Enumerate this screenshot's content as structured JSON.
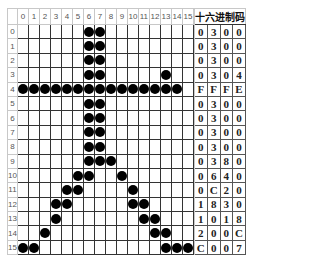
{
  "header": {
    "hex_title": "十六进制码"
  },
  "columns": [
    "0",
    "1",
    "2",
    "3",
    "4",
    "5",
    "6",
    "7",
    "8",
    "9",
    "10",
    "11",
    "12",
    "13",
    "14",
    "15"
  ],
  "rows": [
    {
      "label": "0",
      "bits": [
        0,
        0,
        0,
        0,
        0,
        0,
        1,
        1,
        0,
        0,
        0,
        0,
        0,
        0,
        0,
        0
      ],
      "hex": [
        "0",
        "3",
        "0",
        "0"
      ]
    },
    {
      "label": "1",
      "bits": [
        0,
        0,
        0,
        0,
        0,
        0,
        1,
        1,
        0,
        0,
        0,
        0,
        0,
        0,
        0,
        0
      ],
      "hex": [
        "0",
        "3",
        "0",
        "0"
      ]
    },
    {
      "label": "2",
      "bits": [
        0,
        0,
        0,
        0,
        0,
        0,
        1,
        1,
        0,
        0,
        0,
        0,
        0,
        0,
        0,
        0
      ],
      "hex": [
        "0",
        "3",
        "0",
        "0"
      ]
    },
    {
      "label": "3",
      "bits": [
        0,
        0,
        0,
        0,
        0,
        0,
        1,
        1,
        0,
        0,
        0,
        0,
        0,
        1,
        0,
        0
      ],
      "hex": [
        "0",
        "3",
        "0",
        "4"
      ]
    },
    {
      "label": "4",
      "bits": [
        1,
        1,
        1,
        1,
        1,
        1,
        1,
        1,
        1,
        1,
        1,
        1,
        1,
        1,
        1,
        0
      ],
      "hex": [
        "F",
        "F",
        "F",
        "E"
      ]
    },
    {
      "label": "5",
      "bits": [
        0,
        0,
        0,
        0,
        0,
        0,
        1,
        1,
        0,
        0,
        0,
        0,
        0,
        0,
        0,
        0
      ],
      "hex": [
        "0",
        "3",
        "0",
        "0"
      ]
    },
    {
      "label": "6",
      "bits": [
        0,
        0,
        0,
        0,
        0,
        0,
        1,
        1,
        0,
        0,
        0,
        0,
        0,
        0,
        0,
        0
      ],
      "hex": [
        "0",
        "3",
        "0",
        "0"
      ]
    },
    {
      "label": "7",
      "bits": [
        0,
        0,
        0,
        0,
        0,
        0,
        1,
        1,
        0,
        0,
        0,
        0,
        0,
        0,
        0,
        0
      ],
      "hex": [
        "0",
        "3",
        "0",
        "0"
      ]
    },
    {
      "label": "8",
      "bits": [
        0,
        0,
        0,
        0,
        0,
        0,
        1,
        1,
        0,
        0,
        0,
        0,
        0,
        0,
        0,
        0
      ],
      "hex": [
        "0",
        "3",
        "0",
        "0"
      ]
    },
    {
      "label": "9",
      "bits": [
        0,
        0,
        0,
        0,
        0,
        0,
        1,
        1,
        1,
        0,
        0,
        0,
        0,
        0,
        0,
        0
      ],
      "hex": [
        "0",
        "3",
        "8",
        "0"
      ]
    },
    {
      "label": "10",
      "bits": [
        0,
        0,
        0,
        0,
        0,
        1,
        1,
        0,
        0,
        1,
        0,
        0,
        0,
        0,
        0,
        0
      ],
      "hex": [
        "0",
        "6",
        "4",
        "0"
      ]
    },
    {
      "label": "11",
      "bits": [
        0,
        0,
        0,
        0,
        1,
        1,
        0,
        0,
        0,
        0,
        1,
        0,
        0,
        0,
        0,
        0
      ],
      "hex": [
        "0",
        "C",
        "2",
        "0"
      ]
    },
    {
      "label": "12",
      "bits": [
        0,
        0,
        0,
        1,
        1,
        0,
        0,
        0,
        0,
        0,
        1,
        1,
        0,
        0,
        0,
        0
      ],
      "hex": [
        "1",
        "8",
        "3",
        "0"
      ]
    },
    {
      "label": "13",
      "bits": [
        0,
        0,
        0,
        1,
        0,
        0,
        0,
        0,
        0,
        0,
        0,
        1,
        1,
        0,
        0,
        0
      ],
      "hex": [
        "1",
        "0",
        "1",
        "8"
      ]
    },
    {
      "label": "14",
      "bits": [
        0,
        0,
        1,
        0,
        0,
        0,
        0,
        0,
        0,
        0,
        0,
        0,
        1,
        1,
        0,
        0
      ],
      "hex": [
        "2",
        "0",
        "0",
        "C"
      ]
    },
    {
      "label": "15",
      "bits": [
        1,
        1,
        0,
        0,
        0,
        0,
        0,
        0,
        0,
        0,
        0,
        0,
        0,
        1,
        1,
        1
      ],
      "hex": [
        "C",
        "0",
        "0",
        "7"
      ]
    }
  ],
  "colors": {
    "dot": "#000000",
    "grid_line": "#333333",
    "label_border": "#c8c8c8",
    "background": "#ffffff"
  }
}
